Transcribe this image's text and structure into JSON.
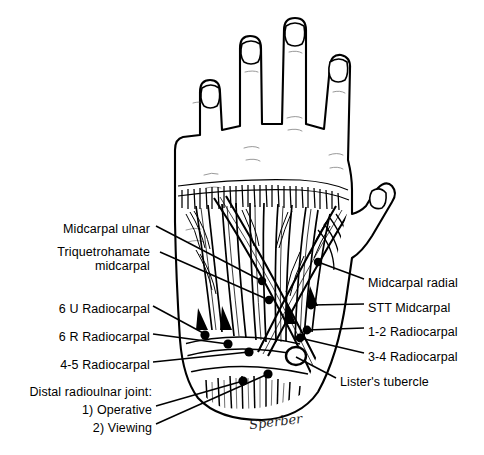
{
  "figure": {
    "ink_color": "#000000",
    "background_color": "#ffffff"
  },
  "labels_left": [
    {
      "text": "Midcarpal ulnar",
      "x": 150,
      "y": 230,
      "tip_x": 262,
      "tip_y": 281
    },
    {
      "text": "Triquetrohamate",
      "x": 150,
      "y": 252,
      "tip_x": 268,
      "tip_y": 300
    },
    {
      "text": "midcarpal",
      "x": 150,
      "y": 266,
      "tip_x": null,
      "tip_y": null
    },
    {
      "text": "6 U Radiocarpal",
      "x": 150,
      "y": 310,
      "tip_x": 205,
      "tip_y": 334
    },
    {
      "text": "6 R Radiocarpal",
      "x": 150,
      "y": 338,
      "tip_x": 228,
      "tip_y": 344
    },
    {
      "text": "4-5 Radiocarpal",
      "x": 150,
      "y": 366,
      "tip_x": 249,
      "tip_y": 352
    },
    {
      "text": "Distal radioulnar joint:",
      "x": 152,
      "y": 392,
      "tip_x": null,
      "tip_y": null
    },
    {
      "text": "1) Operative",
      "x": 152,
      "y": 410,
      "tip_x": 243,
      "tip_y": 381
    },
    {
      "text": "2) Viewing",
      "x": 152,
      "y": 428,
      "tip_x": 268,
      "tip_y": 374
    }
  ],
  "labels_right": [
    {
      "text": "Midcarpal radial",
      "x": 368,
      "y": 283,
      "tip_x": 318,
      "tip_y": 262
    },
    {
      "text": "STT Midcarpal",
      "x": 368,
      "y": 308,
      "tip_x": 311,
      "tip_y": 305
    },
    {
      "text": "1-2 Radiocarpal",
      "x": 368,
      "y": 332,
      "tip_x": 307,
      "tip_y": 330
    },
    {
      "text": "3-4 Radiocarpal",
      "x": 368,
      "y": 357,
      "tip_x": 300,
      "tip_y": 337
    },
    {
      "text": "Lister's tubercle",
      "x": 340,
      "y": 382,
      "tip_x": 296,
      "tip_y": 357
    }
  ],
  "portal_dots": [
    {
      "name": "midcarpal-ulnar-dot",
      "x": 262,
      "y": 281,
      "r": 4.2
    },
    {
      "name": "triquetrohamate-dot",
      "x": 269,
      "y": 300,
      "r": 4.2
    },
    {
      "name": "6u-radiocarpal-dot",
      "x": 205,
      "y": 335,
      "r": 4.6
    },
    {
      "name": "6r-radiocarpal-dot",
      "x": 228,
      "y": 344,
      "r": 4.6
    },
    {
      "name": "4-5-radiocarpal-dot",
      "x": 249,
      "y": 352,
      "r": 4.6
    },
    {
      "name": "drujoint-operative-dot",
      "x": 243,
      "y": 381,
      "r": 4.6
    },
    {
      "name": "drujoint-viewing-dot",
      "x": 268,
      "y": 374,
      "r": 4.6
    },
    {
      "name": "midcarpal-radial-dot",
      "x": 318,
      "y": 262,
      "r": 4.2
    },
    {
      "name": "stt-midcarpal-dot",
      "x": 311,
      "y": 305,
      "r": 4.4
    },
    {
      "name": "1-2-radiocarpal-dot",
      "x": 307,
      "y": 330,
      "r": 4.4
    },
    {
      "name": "3-4-radiocarpal-dot",
      "x": 300,
      "y": 338,
      "r": 4.4
    }
  ],
  "listers_tubercle": {
    "x": 296,
    "y": 356,
    "rx": 10,
    "ry": 9
  },
  "signature": {
    "text": "Sperber",
    "x": 249,
    "y": 424
  }
}
